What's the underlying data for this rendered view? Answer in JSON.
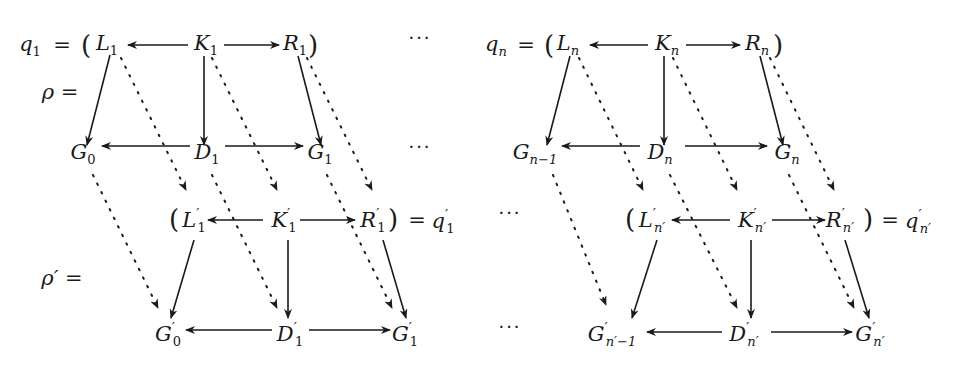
{
  "diagram": {
    "row1_left": {
      "q": "q",
      "q_sub": "1",
      "eq": "=",
      "lparen": "(",
      "L": "L",
      "L_sub": "1",
      "K": "K",
      "K_sub": "1",
      "R": "R",
      "R_sub": "1",
      "rparen": ")"
    },
    "row1_right": {
      "q": "q",
      "q_sub": "n",
      "eq": "=",
      "lparen": "(",
      "L": "L",
      "L_sub": "n",
      "K": "K",
      "K_sub": "n",
      "R": "R",
      "R_sub": "n",
      "rparen": ")"
    },
    "rho_label": "ρ =",
    "rho_prime_label": "ρ′ =",
    "row2_left": {
      "G0": "G",
      "G0_sub": "0",
      "D": "D",
      "D_sub": "1",
      "G1": "G",
      "G1_sub": "1"
    },
    "row2_right": {
      "G": "G",
      "G_sub": "n−1",
      "D": "D",
      "D_sub": "n",
      "Gn": "G",
      "Gn_sub": "n"
    },
    "row3_left": {
      "lparen": "(",
      "L": "L",
      "L_sub": "1",
      "K": "K",
      "K_sub": "1",
      "R": "R",
      "R_sub": "1",
      "rparen": ")",
      "eq": "=",
      "q": "q",
      "q_sub": "1",
      "prime": "′"
    },
    "row3_right": {
      "lparen": "(",
      "L": "L",
      "L_sub": "n′",
      "K": "K",
      "K_sub": "n′",
      "R": "R",
      "R_sub": "n′",
      "rparen": ")",
      "eq": "=",
      "q": "q",
      "q_sub": "n′",
      "prime": "′"
    },
    "row4_left": {
      "G0": "G",
      "G0_sub": "0",
      "D": "D",
      "D_sub": "1",
      "G1": "G",
      "G1_sub": "1",
      "prime": "′"
    },
    "row4_right": {
      "G": "G",
      "G_sub": "n′−1",
      "D": "D",
      "D_sub": "n′",
      "Gn": "G",
      "Gn_sub": "n′",
      "prime": "′"
    },
    "ellipsis": "···",
    "colors": {
      "ink": "#1a1a1a",
      "background": "#ffffff"
    }
  }
}
